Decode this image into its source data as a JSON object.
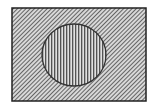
{
  "diagram": {
    "type": "venn-complement",
    "universe": {
      "shape": "rectangle",
      "x": 12,
      "y": 8,
      "width": 134,
      "height": 93,
      "fill_pattern": "diagonal-hatch",
      "stroke": "#222222",
      "hatch_color": "#333333",
      "background": "#d8d8d8"
    },
    "set": {
      "shape": "circle",
      "cx": 74,
      "cy": 55,
      "rx": 32,
      "ry": 31,
      "fill_pattern": "vertical-hatch",
      "stroke": "#333333",
      "hatch_color": "#444444",
      "background": "#e0e0e0"
    }
  }
}
